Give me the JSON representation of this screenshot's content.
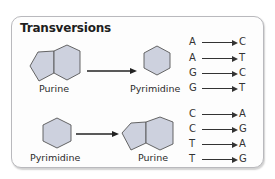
{
  "title": "Transversions",
  "colors": {
    "shape_fill": "#cdd1de",
    "shape_stroke": "#555555",
    "arrow": "#222222",
    "border": "#b9b9bd"
  },
  "top": {
    "from_label": "Purine",
    "to_label": "Pyrimidine",
    "from_shape": "purine-double-ring",
    "to_shape": "pyrimidine-hexagon",
    "pairs": [
      {
        "from": "A",
        "to": "C"
      },
      {
        "from": "A",
        "to": "T"
      },
      {
        "from": "G",
        "to": "C"
      },
      {
        "from": "G",
        "to": "T"
      }
    ]
  },
  "bottom": {
    "from_label": "Pyrimidine",
    "to_label": "Purine",
    "from_shape": "pyrimidine-hexagon",
    "to_shape": "purine-double-ring",
    "pairs": [
      {
        "from": "C",
        "to": "A"
      },
      {
        "from": "C",
        "to": "G"
      },
      {
        "from": "T",
        "to": "A"
      },
      {
        "from": "T",
        "to": "G"
      }
    ]
  }
}
